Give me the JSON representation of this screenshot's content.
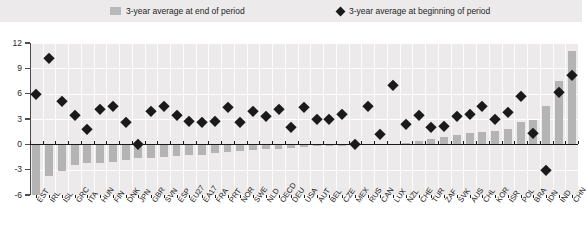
{
  "legend": {
    "end_of_period": {
      "label": "3-year average at end of period",
      "icon": "bar-swatch",
      "color": "#b4b4b4"
    },
    "beginning_of_period": {
      "label": "3-year average at beginning of period",
      "icon": "diamond-marker",
      "color": "#1a1a1a"
    }
  },
  "chart_data": {
    "type": "bar",
    "title": "",
    "subtitle": "",
    "xlabel": "",
    "ylabel": "",
    "ylim": [
      -6,
      12
    ],
    "yticks": [
      -6,
      -3,
      0,
      3,
      6,
      9,
      12
    ],
    "ytick_labels": [
      "-6",
      "-3",
      "0",
      "3",
      "6",
      "9",
      "12"
    ],
    "grid": true,
    "legend_position": "top",
    "categories": [
      "EST",
      "IRL",
      "ISL",
      "GRC",
      "ITA",
      "HUN",
      "FIN",
      "DNK",
      "JPN",
      "GBR",
      "SVN",
      "ESP",
      "EU27",
      "EA17",
      "FRA",
      "PRT",
      "NOR",
      "SWE",
      "NLD",
      "OECD",
      "DEU",
      "USA",
      "AUT",
      "BEL",
      "CZE",
      "MEX",
      "RUS",
      "CAN",
      "LUX",
      "NZL",
      "CHE",
      "TUR",
      "ZAF",
      "SVK",
      "AUS",
      "CHL",
      "KOR",
      "ISR",
      "POL",
      "BRA",
      "IDN",
      "IND",
      "CHN"
    ],
    "series": [
      {
        "name": "3-year average at end of period",
        "type": "bar",
        "color": "#b4b4b4",
        "values": [
          -6.0,
          -3.8,
          -3.2,
          -2.5,
          -2.2,
          -2.2,
          -2.1,
          -1.9,
          -1.6,
          -1.6,
          -1.5,
          -1.4,
          -1.3,
          -1.3,
          -1.0,
          -0.9,
          -0.8,
          -0.7,
          -0.6,
          -0.5,
          -0.4,
          -0.3,
          -0.2,
          -0.2,
          -0.15,
          -0.1,
          -0.05,
          0.0,
          0.0,
          0.2,
          0.4,
          0.6,
          0.9,
          1.1,
          1.3,
          1.5,
          1.6,
          1.8,
          2.6,
          2.9,
          4.5,
          7.5,
          11.0
        ]
      },
      {
        "name": "3-year average at beginning of period",
        "type": "scatter",
        "color": "#1a1a1a",
        "marker": "diamond",
        "values": [
          6.0,
          10.2,
          5.1,
          3.5,
          1.8,
          4.2,
          4.5,
          2.6,
          0.0,
          3.9,
          4.5,
          3.5,
          2.8,
          2.6,
          2.8,
          4.4,
          2.6,
          4.0,
          3.4,
          4.2,
          2.0,
          4.4,
          3.0,
          3.0,
          3.6,
          0.0,
          4.5,
          1.2,
          7.0,
          2.4,
          3.5,
          2.0,
          2.2,
          3.4,
          3.6,
          4.5,
          3.0,
          3.8,
          5.7,
          1.3,
          -3.0,
          6.2,
          8.2
        ]
      }
    ]
  }
}
